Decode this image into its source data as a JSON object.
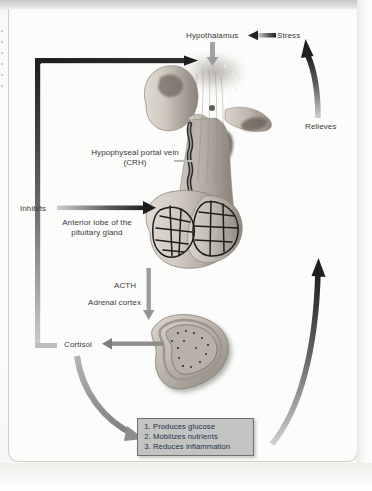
{
  "diagram": {
    "labels": {
      "hypothalamus": "Hypothalamus",
      "stress": "Stress",
      "relieves": "Relieves",
      "portal_vein": "Hypophyseal portal vein (CRH)",
      "inhibits": "Inhibits",
      "anterior_lobe": "Anterior lobe of the pituitary gland",
      "acth": "ACTH",
      "adrenal_cortex": "Adrenal cortex",
      "cortisol": "Cortisol"
    },
    "effects_box": {
      "items": [
        "Produces glucose",
        "Mobilizes nutrients",
        "Reduces inflammation"
      ]
    },
    "colors": {
      "arrow_dark": "#2b2b2b",
      "arrow_gray": "#9a9a9a",
      "tissue_light": "#cfc9c0",
      "tissue_mid": "#aaa49a",
      "tissue_dark": "#80796f",
      "box_fill": "#c3c4c2",
      "box_border": "#6f706e",
      "box_text": "#22304a",
      "label_text": "#3a3a3a",
      "page": "#fcfcfa"
    }
  }
}
